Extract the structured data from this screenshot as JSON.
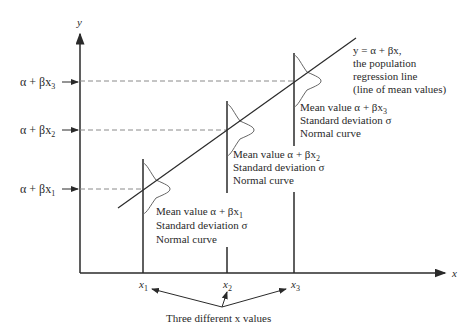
{
  "diagram": {
    "y_axis_label": "y",
    "x_axis_label": "x",
    "y_tick_labels": [
      {
        "text_main": "α + βx",
        "sub": "3"
      },
      {
        "text_main": "α + βx",
        "sub": "2"
      },
      {
        "text_main": "α + βx",
        "sub": "1"
      }
    ],
    "x_tick_labels": [
      {
        "text_main": "x",
        "sub": "1"
      },
      {
        "text_main": "x",
        "sub": "2"
      },
      {
        "text_main": "x",
        "sub": "3"
      }
    ],
    "regression_label": {
      "line1": "y = α + βx,",
      "line2": "the population",
      "line3": "regression line",
      "line4": "(line of mean values)"
    },
    "annotations": [
      {
        "mean": "Mean value α + βx",
        "sub": "1",
        "sd": "Standard deviation σ",
        "curve": "Normal curve"
      },
      {
        "mean": "Mean value α + βx",
        "sub": "2",
        "sd": "Standard deviation σ",
        "curve": "Normal curve"
      },
      {
        "mean": "Mean value α + βx",
        "sub": "3",
        "sd": "Standard deviation σ",
        "curve": "Normal curve"
      }
    ],
    "bottom_caption": "Three different x values",
    "colors": {
      "line": "#2a2a2a",
      "dashed": "#8a8a8a",
      "curve": "#555555"
    }
  }
}
